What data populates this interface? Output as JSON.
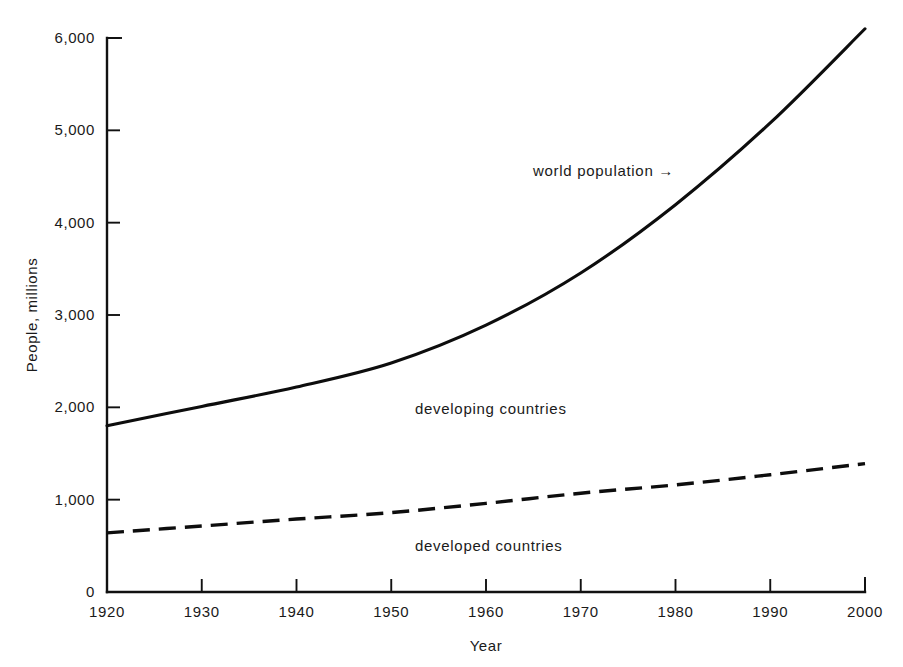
{
  "chart_data": {
    "type": "line",
    "title": "",
    "xlabel": "Year",
    "ylabel": "People, millions",
    "xlim": [
      1920,
      2000
    ],
    "ylim": [
      0,
      6000
    ],
    "grid": false,
    "legend_position": "inline-annotations",
    "x": [
      1920,
      1930,
      1940,
      1950,
      1960,
      1970,
      1980,
      1990,
      2000
    ],
    "xticklabels": [
      "1920",
      "1930",
      "1940",
      "1950",
      "1960",
      "1970",
      "1980",
      "1990",
      "2000"
    ],
    "yticks": [
      0,
      1000,
      2000,
      3000,
      4000,
      5000,
      6000
    ],
    "yticklabels": [
      "0",
      "1,000",
      "2,000",
      "3,000",
      "4,000",
      "5,000",
      "6,000"
    ],
    "series": [
      {
        "name": "world population",
        "style": "solid",
        "values": [
          1800,
          2010,
          2220,
          2480,
          2890,
          3455,
          4195,
          5080,
          6100
        ]
      },
      {
        "name": "developed countries",
        "style": "dashed",
        "values": [
          640,
          715,
          790,
          860,
          960,
          1070,
          1160,
          1270,
          1390
        ]
      }
    ],
    "annotations": [
      {
        "text": "world population →",
        "x": 1984,
        "y": 4570,
        "role": "pointer-label-solid-curve"
      },
      {
        "text": "developing countries",
        "x": 1958,
        "y": 1970,
        "role": "band-label-between-curves"
      },
      {
        "text": "developed countries",
        "x": 1958,
        "y": 520,
        "role": "band-label-below-dashed-curve"
      }
    ],
    "colors": {
      "line": "#0d0d0d",
      "axis": "#111111",
      "background": "#ffffff",
      "text": "#1a1a1a"
    }
  }
}
